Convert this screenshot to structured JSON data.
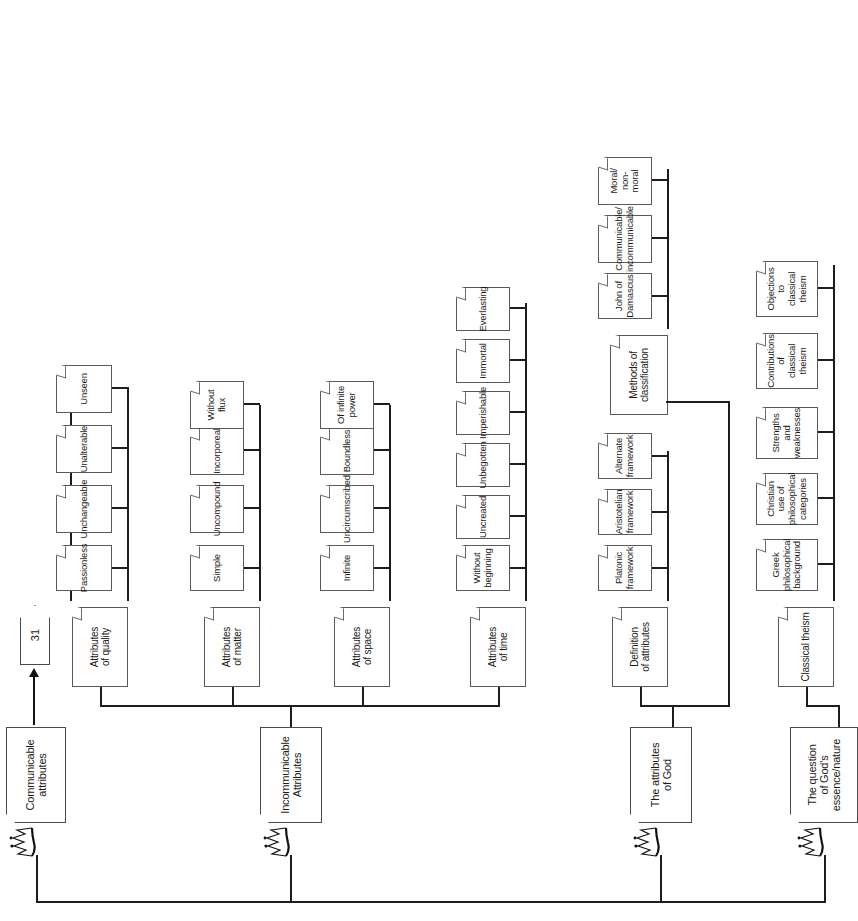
{
  "diagram": {
    "title": "The attributes of God",
    "type": "hierarchical-outline-tree",
    "orientation": "rotated-90-ccw",
    "offpage_connector": {
      "label": "31",
      "name": "page-reference"
    },
    "colors": {
      "line": "#1d1d1d",
      "box_border": "#5a5a5a",
      "background": "#ffffff",
      "text": "#1a1a1a"
    }
  },
  "branches": [
    {
      "id": "communicable",
      "label": "Communicable\nattributes",
      "children": []
    },
    {
      "id": "incommunicable",
      "label": "Incommunicable\nAttributes",
      "groups": [
        {
          "id": "quality",
          "label": "Attributes\nof quality",
          "items": [
            "Passionless",
            "Unchangeable",
            "Unalterable",
            "Unseen"
          ]
        },
        {
          "id": "matter",
          "label": "Attributes\nof matter",
          "items": [
            "Simple",
            "Uncompound",
            "Incorporeal",
            "Without\nflux"
          ]
        },
        {
          "id": "space",
          "label": "Attributes\nof space",
          "items": [
            "Infinite",
            "Uncircumscribed",
            "Boundless",
            "Of infinite\npower"
          ]
        },
        {
          "id": "time",
          "label": "Attributes\nof time",
          "items": [
            "Without\nbeginning",
            "Uncreated",
            "Unbegotten",
            "Imperishable",
            "Immortal",
            "Everlasting"
          ]
        }
      ]
    },
    {
      "id": "attributes-of-god",
      "label": "The attributes\nof God",
      "groups": [
        {
          "id": "definition",
          "label": "Definition\nof attributes",
          "items": [
            "Platonic\nframework",
            "Aristotelian\nframework",
            "Alternate\nframework"
          ]
        },
        {
          "id": "methods",
          "label": "Methods of\nclassification",
          "items": [
            "John of\nDamascus",
            "Communicable/\nincommunicable",
            "Moral/\nnon-moral"
          ]
        }
      ]
    },
    {
      "id": "essence",
      "label": "The question\nof God's\nessence/nature",
      "groups": [
        {
          "id": "classical-theism",
          "label": "Classical theism",
          "items": [
            "Greek\nphilosophical\nbackground",
            "Christian use of\nphilosophical\ncategories",
            "Strengths and\nweaknesses",
            "Contributions of\nclassical theism",
            "Objections to\nclassical theism"
          ]
        }
      ]
    }
  ]
}
